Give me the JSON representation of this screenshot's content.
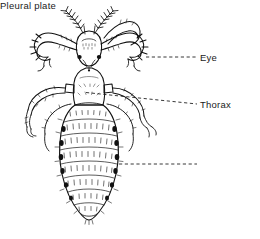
{
  "figure": {
    "background_color": "#ffffff",
    "ink_color": "#111111",
    "labels": [
      {
        "id": "eye",
        "text": "Eye",
        "leader": "dashed",
        "anchor_x": 146,
        "anchor_y": 57,
        "text_x": 200,
        "text_y": 57
      },
      {
        "id": "thorax",
        "text": "Thorax",
        "leader": "dashed",
        "anchor_x": 86,
        "anchor_y": 93,
        "text_x": 200,
        "text_y": 104
      },
      {
        "id": "pleural_plate",
        "text": "Pleural plate",
        "leader": "dashed",
        "anchor_x": 119,
        "anchor_y": 164,
        "text_x": 200,
        "text_y": 164
      }
    ],
    "anatomy": [
      "antennae",
      "head",
      "eye-spots",
      "thorax",
      "legs-with-claws",
      "abdomen-segments",
      "pleural-plates",
      "setae"
    ]
  }
}
